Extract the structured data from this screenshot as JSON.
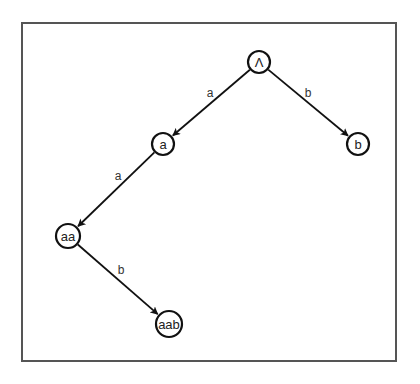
{
  "diagram": {
    "type": "tree",
    "colors": {
      "stroke": "#111111",
      "frame": "#555555",
      "background": "#ffffff",
      "text": "#222222"
    },
    "nodes": [
      {
        "id": "root",
        "label": "Λ",
        "x": 259,
        "y": 62,
        "r": 11
      },
      {
        "id": "a",
        "label": "a",
        "x": 163,
        "y": 144,
        "r": 11
      },
      {
        "id": "b",
        "label": "b",
        "x": 358,
        "y": 144,
        "r": 11
      },
      {
        "id": "aa",
        "label": "aa",
        "x": 68,
        "y": 236,
        "r": 12
      },
      {
        "id": "aab",
        "label": "aab",
        "x": 169,
        "y": 324,
        "r": 13
      }
    ],
    "edges": [
      {
        "from": "root",
        "to": "a",
        "label": "a",
        "lx": 210,
        "ly": 93
      },
      {
        "from": "root",
        "to": "b",
        "label": "b",
        "lx": 308,
        "ly": 93
      },
      {
        "from": "a",
        "to": "aa",
        "label": "a",
        "lx": 118,
        "ly": 176
      },
      {
        "from": "aa",
        "to": "aab",
        "label": "b",
        "lx": 121,
        "ly": 270
      }
    ]
  }
}
